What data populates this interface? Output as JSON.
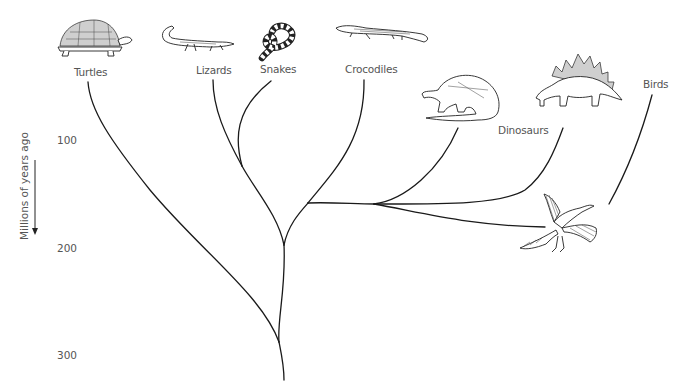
{
  "diagram": {
    "type": "phylogenetic-tree",
    "axis": {
      "title": "Millions of years ago",
      "ticks": [
        {
          "label": "100",
          "y": 140
        },
        {
          "label": "200",
          "y": 248
        },
        {
          "label": "300",
          "y": 355
        }
      ],
      "arrow_direction": "down"
    },
    "taxa": [
      {
        "id": "turtles",
        "label": "Turtles",
        "illustration": "tortoise"
      },
      {
        "id": "lizards",
        "label": "Lizards",
        "illustration": "lizard"
      },
      {
        "id": "snakes",
        "label": "Snakes",
        "illustration": "banded-snake"
      },
      {
        "id": "crocodiles",
        "label": "Crocodiles",
        "illustration": "crocodile"
      },
      {
        "id": "dinosaurs",
        "label": "Dinosaurs",
        "illustration": [
          "sauropod",
          "stegosaurus"
        ]
      },
      {
        "id": "birds",
        "label": "Birds",
        "illustration": "archaeopteryx"
      }
    ],
    "colors": {
      "line": "#1a1a1a",
      "text": "#555555",
      "background": "#ffffff"
    }
  }
}
